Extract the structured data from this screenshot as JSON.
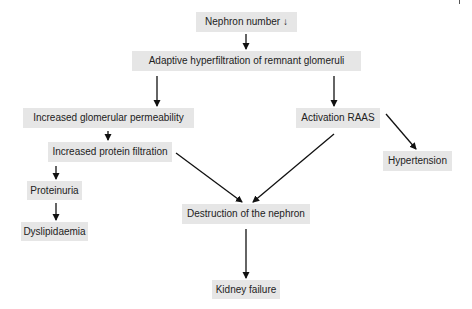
{
  "diagram": {
    "type": "flowchart",
    "colors": {
      "node_fill": "#e6e6e6",
      "text": "#222222",
      "arrow": "#111111",
      "background": "#ffffff"
    },
    "nodes": {
      "nephron_number": "Nephron number ↓",
      "hyperfiltration": "Adaptive hyperfiltration of remnant glomeruli",
      "glomerular_permeability": "Increased glomerular permeability",
      "activation_raas": "Activation RAAS",
      "protein_filtration": "Increased protein filtration",
      "hypertension": "Hypertension",
      "proteinuria": "Proteinuria",
      "dyslipidaemia": "Dyslipidaemia",
      "destruction": "Destruction of the nephron",
      "kidney_failure": "Kidney failure"
    },
    "edges": [
      {
        "from": "nephron_number",
        "to": "hyperfiltration"
      },
      {
        "from": "hyperfiltration",
        "to": "glomerular_permeability"
      },
      {
        "from": "hyperfiltration",
        "to": "activation_raas"
      },
      {
        "from": "glomerular_permeability",
        "to": "protein_filtration"
      },
      {
        "from": "protein_filtration",
        "to": "proteinuria"
      },
      {
        "from": "proteinuria",
        "to": "dyslipidaemia"
      },
      {
        "from": "protein_filtration",
        "to": "destruction"
      },
      {
        "from": "activation_raas",
        "to": "destruction"
      },
      {
        "from": "activation_raas",
        "to": "hypertension"
      },
      {
        "from": "destruction",
        "to": "kidney_failure"
      }
    ]
  }
}
